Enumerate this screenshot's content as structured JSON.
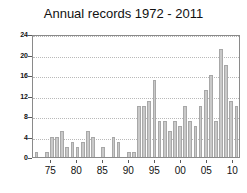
{
  "chart_data": {
    "type": "bar",
    "title": "Annual records 1972 - 2011",
    "xlabel": "",
    "ylabel": "",
    "ylim": [
      0,
      24
    ],
    "yticks": [
      0,
      4,
      8,
      12,
      16,
      20,
      24
    ],
    "ytick_labels": [
      "0",
      "4",
      "8",
      "12",
      "16",
      "20",
      "24"
    ],
    "xtick_labels": [
      "75",
      "80",
      "85",
      "90",
      "95",
      "00",
      "05",
      "10"
    ],
    "xtick_years": [
      1975,
      1980,
      1985,
      1990,
      1995,
      2000,
      2005,
      2010
    ],
    "grid": true,
    "legend": false,
    "bar_color": "#c9c9c9",
    "bar_edge_color": "#a8a8a8",
    "axes_color": "#8a8a8a",
    "grid_color": "#b9b9b9",
    "categories": [
      "1972",
      "1973",
      "1974",
      "1975",
      "1976",
      "1977",
      "1978",
      "1979",
      "1980",
      "1981",
      "1982",
      "1983",
      "1984",
      "1985",
      "1986",
      "1987",
      "1988",
      "1989",
      "1990",
      "1991",
      "1992",
      "1993",
      "1994",
      "1995",
      "1996",
      "1997",
      "1998",
      "1999",
      "2000",
      "2001",
      "2002",
      "2003",
      "2004",
      "2005",
      "2006",
      "2007",
      "2008",
      "2009",
      "2010",
      "2011"
    ],
    "values": [
      1,
      0,
      1,
      4,
      4,
      5,
      2,
      3,
      2,
      3,
      5,
      4,
      0,
      2,
      0,
      4,
      3,
      0,
      1,
      1,
      10,
      10,
      11,
      15,
      7,
      7,
      5,
      7,
      6,
      10,
      7,
      6,
      10,
      13,
      16,
      7,
      21,
      18,
      11,
      10
    ]
  }
}
